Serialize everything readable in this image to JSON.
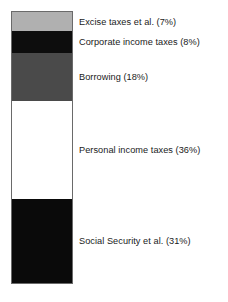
{
  "chart_data": {
    "type": "bar",
    "subtype": "stacked-bar-single-column",
    "title": "",
    "subtitle": "",
    "xlabel": "",
    "ylabel": "",
    "grid": false,
    "legend_position": "right-inline",
    "total_percent": 100,
    "orientation": "vertical",
    "stack_order_top_to_bottom": [
      "Excise taxes et al.",
      "Corporate income taxes",
      "Borrowing",
      "Personal income taxes",
      "Social Security et al."
    ],
    "categories": [
      "Excise taxes et al.",
      "Corporate income taxes",
      "Borrowing",
      "Personal income taxes",
      "Social Security et al."
    ],
    "values": [
      7,
      8,
      18,
      36,
      31
    ],
    "segments": [
      {
        "name": "Excise taxes et al.",
        "label": "Excise taxes et al. (7%)",
        "value": 7,
        "percent_text": "(7%)",
        "color": "#b0b0b0"
      },
      {
        "name": "Corporate income taxes",
        "label": "Corporate income taxes (8%)",
        "value": 8,
        "percent_text": "(8%)",
        "color": "#0d0d0d"
      },
      {
        "name": "Borrowing",
        "label": "Borrowing (18%)",
        "value": 18,
        "percent_text": "(18%)",
        "color": "#4a4a4a"
      },
      {
        "name": "Personal income taxes",
        "label": "Personal income taxes (36%)",
        "value": 36,
        "percent_text": "(36%)",
        "color": "#ffffff"
      },
      {
        "name": "Social Security et al.",
        "label": "Social Security et al. (31%)",
        "value": 31,
        "percent_text": "(31%)",
        "color": "#0a0a0a"
      }
    ]
  },
  "style": {
    "background": "#ffffff",
    "text_color": "#1a1a1a",
    "bar_border_color": "#6a6a6a"
  }
}
